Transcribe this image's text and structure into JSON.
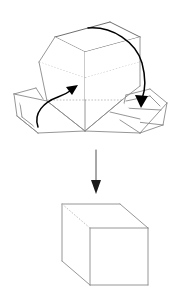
{
  "figure": {
    "title": "Box folding instruction diagram",
    "background_color": "#ffffff",
    "line_color": "#8a8a8a",
    "hidden_line_color": "#b9b9b9",
    "arrow_color": "#000000",
    "canvas": {
      "width": 181,
      "height": 292
    },
    "steps": [
      {
        "id": "step-unfolded",
        "label": "Partially folded carton with open side flaps"
      },
      {
        "id": "step-transition",
        "label": "Fold and close"
      },
      {
        "id": "step-cube",
        "label": "Assembled closed cube"
      }
    ],
    "parts": {
      "upper_assembly_name": "unfolded-box",
      "lower_assembly_name": "assembled-cube",
      "left_fold_arrow_name": "left-fold-arrow",
      "right_fold_arrow_name": "right-fold-arrow",
      "transition_arrow_name": "downward-transition-arrow"
    }
  },
  "geometry": {
    "upper_box": {
      "top_face": "55,37 110,22 140,37 85,52",
      "left_panel": "39,62 55,37 85,52 85,100",
      "front_panel": "85,52 140,37 140,86 85,100",
      "hidden_ridge_top": "39,62 85,78 140,62",
      "hidden_ridge_mid": "47,100 85,100 140,100"
    },
    "cube": {
      "top_face": "62,204 120,204 148,228 90,228",
      "front_face": "90,228 148,228 148,285 90,285",
      "left_face": "62,204 90,228 90,285 62,261",
      "hidden_diagonal": "62,204 90,228"
    },
    "arrows": {
      "down_arrow": {
        "x": 96,
        "y_start": 150,
        "y_end": 192
      },
      "left_fold": {
        "start": "40,123 ",
        "end": "72,88"
      },
      "right_fold": {
        "start": "88,28",
        "end": "143,105"
      }
    }
  }
}
